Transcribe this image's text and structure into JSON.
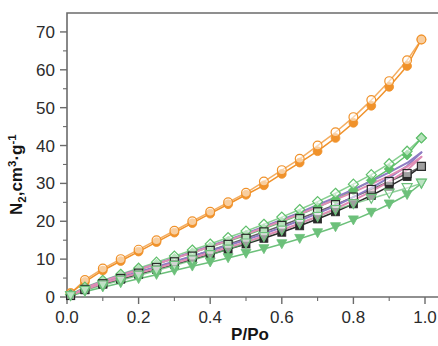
{
  "figure": {
    "background_color": "#ffffff",
    "frame_color": "#6b6b6b",
    "type": "nitrogen-adsorption-desorption-isotherm"
  },
  "chart_data": {
    "type": "line",
    "title": "",
    "subtitle": "",
    "xlabel": "P/Po",
    "ylabel": "N2,cm3.g-1",
    "ylabel_parts": {
      "base1": "N",
      "sub1": "2",
      "base2": ",cm",
      "sup1": "3",
      "base3": "·g",
      "sup2": "-1"
    },
    "xlim": [
      0.0,
      1.0
    ],
    "ylim": [
      0,
      75
    ],
    "xticks": [
      0.0,
      0.2,
      0.4,
      0.6,
      0.8,
      1.0
    ],
    "xtick_labels": [
      "0.0",
      "0.2",
      "0.4",
      "0.6",
      "0.8",
      "1.0"
    ],
    "yticks": [
      0,
      10,
      20,
      30,
      40,
      50,
      60,
      70
    ],
    "ytick_labels": [
      "0",
      "10",
      "20",
      "30",
      "40",
      "50",
      "60",
      "70"
    ],
    "x_minor_ticks": [
      0.1,
      0.3,
      0.5,
      0.7,
      0.9
    ],
    "y_minor_ticks": [
      5,
      15,
      25,
      35,
      45,
      55,
      65
    ],
    "grid": false,
    "legend": false,
    "legend_position": "none",
    "marker_note": "filled markers = adsorption branch, open markers = desorption branch",
    "series": [
      {
        "name": "sample-orange-adsorption",
        "color": "#F0922B",
        "marker": "circle",
        "marker_style": "filled",
        "branch": "adsorption",
        "x": [
          0.01,
          0.05,
          0.1,
          0.15,
          0.2,
          0.25,
          0.3,
          0.35,
          0.4,
          0.45,
          0.5,
          0.55,
          0.6,
          0.65,
          0.7,
          0.75,
          0.8,
          0.85,
          0.9,
          0.95,
          0.99
        ],
        "y": [
          1.0,
          4.0,
          7.0,
          9.5,
          12.0,
          14.5,
          17.0,
          19.5,
          22.0,
          24.5,
          27.0,
          29.5,
          32.5,
          35.5,
          38.5,
          42.0,
          46.0,
          50.5,
          55.5,
          61.0,
          68.0
        ]
      },
      {
        "name": "sample-orange-desorption",
        "color": "#F0922B",
        "marker": "circle",
        "marker_style": "open",
        "branch": "desorption",
        "x": [
          0.99,
          0.95,
          0.9,
          0.85,
          0.8,
          0.75,
          0.7,
          0.65,
          0.6,
          0.55,
          0.5,
          0.45,
          0.4,
          0.35,
          0.3,
          0.25,
          0.2,
          0.15,
          0.1,
          0.05,
          0.01
        ],
        "y": [
          68.0,
          62.5,
          57.0,
          52.0,
          47.5,
          43.5,
          40.0,
          36.5,
          33.5,
          30.5,
          27.5,
          25.0,
          22.5,
          20.0,
          17.5,
          15.0,
          12.5,
          10.0,
          7.5,
          4.5,
          1.0
        ]
      },
      {
        "name": "sample-green-diamond-adsorption",
        "color": "#5FBF6B",
        "marker": "diamond",
        "marker_style": "filled",
        "branch": "adsorption",
        "x": [
          0.01,
          0.05,
          0.1,
          0.15,
          0.2,
          0.25,
          0.3,
          0.35,
          0.4,
          0.45,
          0.5,
          0.55,
          0.6,
          0.65,
          0.7,
          0.75,
          0.8,
          0.85,
          0.9,
          0.95,
          0.99
        ],
        "y": [
          0.6,
          2.4,
          4.2,
          5.7,
          7.2,
          8.7,
          10.2,
          11.7,
          13.2,
          14.7,
          16.3,
          18.0,
          19.8,
          21.7,
          23.7,
          25.8,
          28.2,
          30.8,
          33.8,
          37.5,
          42.0
        ]
      },
      {
        "name": "sample-green-diamond-desorption",
        "color": "#5FBF6B",
        "marker": "diamond",
        "marker_style": "open",
        "branch": "desorption",
        "x": [
          0.99,
          0.95,
          0.9,
          0.85,
          0.8,
          0.75,
          0.7,
          0.65,
          0.6,
          0.55,
          0.5,
          0.45,
          0.4,
          0.35,
          0.3,
          0.25,
          0.2,
          0.15,
          0.1,
          0.05,
          0.01
        ],
        "y": [
          42.0,
          38.5,
          35.2,
          32.3,
          29.8,
          27.4,
          25.2,
          23.1,
          21.1,
          19.2,
          17.4,
          15.7,
          14.0,
          12.4,
          10.8,
          9.2,
          7.6,
          6.0,
          4.4,
          2.6,
          0.6
        ]
      },
      {
        "name": "sample-black-square-adsorption",
        "color": "#2A2A2A",
        "marker": "square",
        "marker_style": "filled",
        "branch": "adsorption",
        "x": [
          0.01,
          0.05,
          0.1,
          0.15,
          0.2,
          0.25,
          0.3,
          0.35,
          0.4,
          0.45,
          0.5,
          0.55,
          0.6,
          0.65,
          0.7,
          0.75,
          0.8,
          0.85,
          0.9,
          0.95,
          0.99
        ],
        "y": [
          0.4,
          1.9,
          3.4,
          4.7,
          6.0,
          7.3,
          8.6,
          9.9,
          11.2,
          12.6,
          14.0,
          15.5,
          17.1,
          18.8,
          20.6,
          22.5,
          24.6,
          26.8,
          29.2,
          31.8,
          34.5
        ]
      },
      {
        "name": "sample-black-square-desorption",
        "color": "#2A2A2A",
        "marker": "square",
        "marker_style": "open",
        "branch": "desorption",
        "x": [
          0.99,
          0.95,
          0.9,
          0.85,
          0.8,
          0.75,
          0.7,
          0.65,
          0.6,
          0.55,
          0.5,
          0.45,
          0.4,
          0.35,
          0.3,
          0.25,
          0.2,
          0.15,
          0.1,
          0.05,
          0.01
        ],
        "y": [
          34.5,
          32.6,
          30.5,
          28.4,
          26.4,
          24.4,
          22.5,
          20.7,
          18.9,
          17.2,
          15.5,
          13.9,
          12.3,
          10.8,
          9.3,
          7.8,
          6.3,
          4.9,
          3.5,
          2.0,
          0.4
        ]
      },
      {
        "name": "sample-green-triangle-adsorption",
        "color": "#6CC07A",
        "marker": "triangle-down",
        "marker_style": "filled",
        "branch": "adsorption",
        "x": [
          0.01,
          0.05,
          0.1,
          0.15,
          0.2,
          0.25,
          0.3,
          0.35,
          0.4,
          0.45,
          0.5,
          0.55,
          0.6,
          0.65,
          0.7,
          0.75,
          0.8,
          0.85,
          0.9,
          0.95,
          0.99
        ],
        "y": [
          0.3,
          1.4,
          2.6,
          3.7,
          4.8,
          5.9,
          7.0,
          8.1,
          9.2,
          10.3,
          11.5,
          12.7,
          14.0,
          15.4,
          16.9,
          18.5,
          20.3,
          22.3,
          24.5,
          27.0,
          30.0
        ]
      },
      {
        "name": "sample-green-triangle-desorption",
        "color": "#6CC07A",
        "marker": "triangle-down",
        "marker_style": "open",
        "branch": "desorption",
        "x": [
          0.99,
          0.95,
          0.9,
          0.85,
          0.8,
          0.75,
          0.7,
          0.65,
          0.6,
          0.55,
          0.5,
          0.45,
          0.4,
          0.35,
          0.3,
          0.25,
          0.2,
          0.15,
          0.1,
          0.05,
          0.01
        ],
        "y": [
          30.0,
          28.8,
          27.4,
          26.0,
          24.6,
          23.0,
          21.2,
          19.4,
          17.6,
          15.9,
          14.2,
          12.6,
          11.1,
          9.7,
          8.3,
          7.0,
          5.7,
          4.4,
          3.1,
          1.7,
          0.3
        ]
      },
      {
        "name": "sample-purple-adsorption",
        "color": "#8E7CC3",
        "marker": "none",
        "marker_style": "line",
        "branch": "adsorption",
        "x": [
          0.01,
          0.05,
          0.1,
          0.15,
          0.2,
          0.25,
          0.3,
          0.35,
          0.4,
          0.45,
          0.5,
          0.55,
          0.6,
          0.65,
          0.7,
          0.75,
          0.8,
          0.85,
          0.9,
          0.95,
          0.99
        ],
        "y": [
          0.5,
          2.1,
          3.8,
          5.2,
          6.6,
          8.0,
          9.4,
          10.8,
          12.2,
          13.6,
          15.1,
          16.7,
          18.4,
          20.2,
          22.1,
          24.1,
          26.4,
          28.8,
          31.5,
          34.6,
          38.2
        ]
      },
      {
        "name": "sample-purple-desorption",
        "color": "#8E7CC3",
        "marker": "none",
        "marker_style": "line",
        "branch": "desorption",
        "x": [
          0.99,
          0.95,
          0.9,
          0.85,
          0.8,
          0.75,
          0.7,
          0.65,
          0.6,
          0.55,
          0.5,
          0.45,
          0.4,
          0.35,
          0.3,
          0.25,
          0.2,
          0.15,
          0.1,
          0.05,
          0.01
        ],
        "y": [
          38.2,
          35.4,
          32.9,
          30.6,
          28.4,
          26.3,
          24.3,
          22.3,
          20.4,
          18.6,
          16.8,
          15.1,
          13.5,
          11.9,
          10.3,
          8.8,
          7.3,
          5.8,
          4.2,
          2.4,
          0.5
        ]
      },
      {
        "name": "sample-pink-adsorption",
        "color": "#E08CB4",
        "marker": "none",
        "marker_style": "line",
        "branch": "adsorption",
        "x": [
          0.01,
          0.05,
          0.1,
          0.15,
          0.2,
          0.25,
          0.3,
          0.35,
          0.4,
          0.45,
          0.5,
          0.55,
          0.6,
          0.65,
          0.7,
          0.75,
          0.8,
          0.85,
          0.9,
          0.95,
          0.99
        ],
        "y": [
          0.45,
          2.0,
          3.6,
          5.0,
          6.3,
          7.6,
          8.9,
          10.3,
          11.7,
          13.1,
          14.5,
          16.1,
          17.7,
          19.4,
          21.3,
          23.3,
          25.5,
          27.9,
          30.5,
          33.5,
          37.0
        ]
      },
      {
        "name": "sample-pink-desorption",
        "color": "#E08CB4",
        "marker": "none",
        "marker_style": "line",
        "branch": "desorption",
        "x": [
          0.99,
          0.95,
          0.9,
          0.85,
          0.8,
          0.75,
          0.7,
          0.65,
          0.6,
          0.55,
          0.5,
          0.45,
          0.4,
          0.35,
          0.3,
          0.25,
          0.2,
          0.15,
          0.1,
          0.05,
          0.01
        ],
        "y": [
          37.0,
          34.4,
          32.0,
          29.8,
          27.7,
          25.7,
          23.8,
          21.9,
          20.1,
          18.3,
          16.6,
          14.9,
          13.3,
          11.7,
          10.2,
          8.7,
          7.2,
          5.7,
          4.1,
          2.3,
          0.45
        ]
      }
    ]
  }
}
